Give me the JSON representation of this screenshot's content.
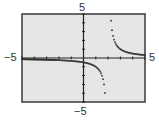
{
  "chart_data": {
    "type": "line",
    "title": "",
    "xlabel": "",
    "ylabel": "",
    "xlim": [
      -5,
      5
    ],
    "ylim": [
      -5,
      5
    ],
    "x_ticks_step": 1,
    "y_ticks_step": 1,
    "grid": false,
    "window_labels": {
      "xmin": "−5",
      "xmax": "5",
      "ymin": "−5",
      "ymax": "5"
    },
    "vertical_asymptote_x": 2,
    "horizontal_asymptote_y": 0,
    "series": [
      {
        "name": "f(x) ≈ 1/(x−2)",
        "style": "dotted",
        "left_branch": {
          "x": [
            -5,
            -4,
            -3,
            -2,
            -1,
            0,
            0.5,
            1,
            1.3,
            1.5,
            1.6,
            1.7,
            1.75
          ],
          "y": [
            -0.14,
            -0.17,
            -0.2,
            -0.25,
            -0.33,
            -0.5,
            -0.67,
            -1,
            -1.43,
            -2,
            -2.5,
            -3.33,
            -4
          ]
        },
        "right_branch": {
          "x": [
            2.2,
            2.3,
            2.4,
            2.5,
            2.7,
            3,
            3.5,
            4,
            4.5,
            5
          ],
          "y": [
            5,
            3.33,
            2.5,
            2,
            1.43,
            1,
            0.67,
            0.5,
            0.4,
            0.33
          ]
        }
      }
    ]
  },
  "colors": {
    "screen_bg": "#e6e6e6",
    "frame": "#3a3a3a",
    "axis": "#222222",
    "curve": "#333333",
    "label": "#333333"
  }
}
